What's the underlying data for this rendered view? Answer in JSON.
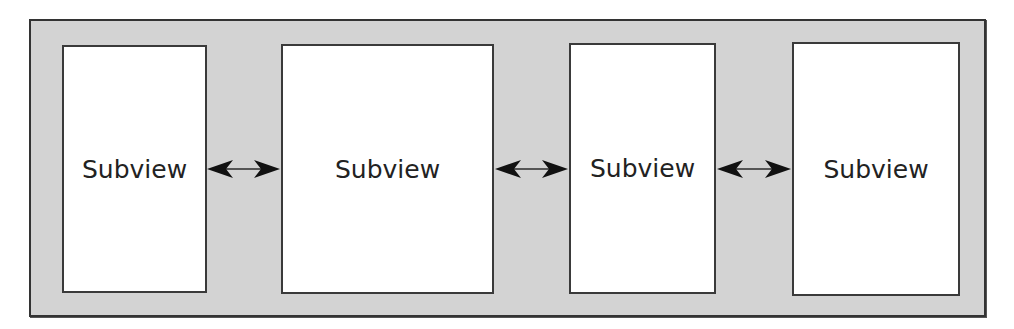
{
  "diagram": {
    "container": {
      "label": "",
      "fill": "#d3d3d3",
      "border": "#333333"
    },
    "subviews": [
      {
        "label": "Subview"
      },
      {
        "label": "Subview"
      },
      {
        "label": "Subview"
      },
      {
        "label": "Subview"
      }
    ],
    "connections": [
      {
        "from": 0,
        "to": 1,
        "type": "bidirectional-arrow"
      },
      {
        "from": 1,
        "to": 2,
        "type": "bidirectional-arrow"
      },
      {
        "from": 2,
        "to": 3,
        "type": "bidirectional-arrow"
      }
    ]
  }
}
